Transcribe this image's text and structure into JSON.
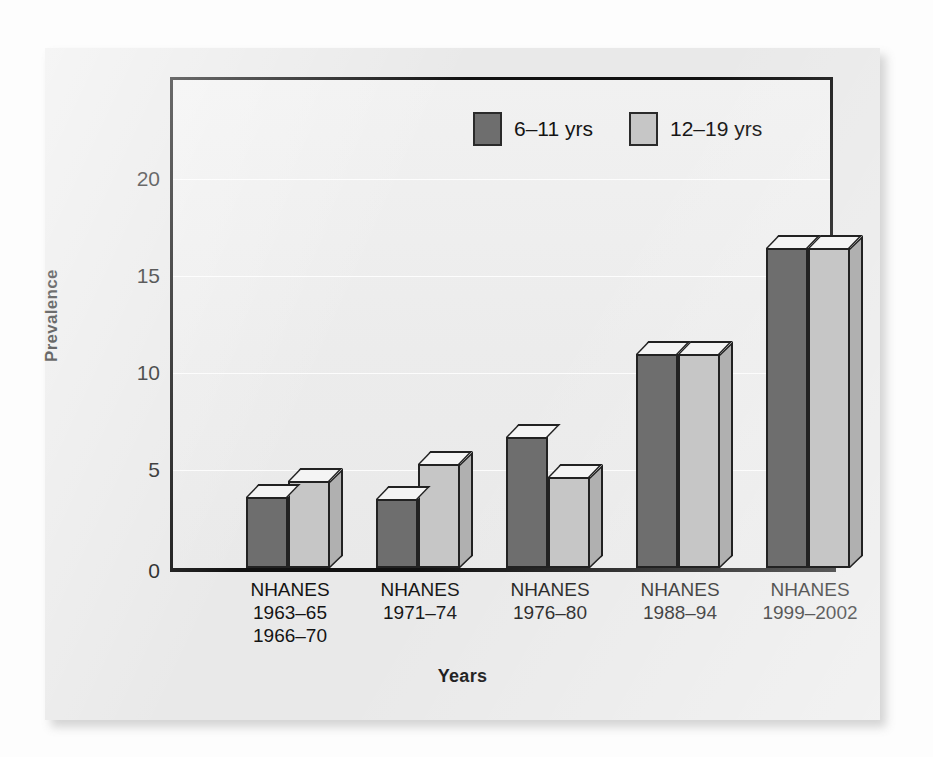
{
  "chart_data": {
    "type": "bar",
    "title": "",
    "xlabel": "Years",
    "ylabel": "Prevalence",
    "ylim": [
      0,
      23.5
    ],
    "yticks": [
      0,
      5,
      10,
      15,
      20
    ],
    "ytick_labels": [
      "0",
      "5",
      "10",
      "15",
      "20"
    ],
    "grid": true,
    "legend_position": "top-center",
    "style": "3d-bar",
    "categories": [
      "NHANES\n1963–65\n1966–70",
      "NHANES\n1971–74",
      "NHANES\n1976–80",
      "NHANES\n1988–94",
      "NHANES\n1999–2002"
    ],
    "series": [
      {
        "name": "6–11 yrs",
        "color": "#6e6e6e",
        "values": [
          3.4,
          3.3,
          6.3,
          10.3,
          15.4
        ]
      },
      {
        "name": "12–19 yrs",
        "color": "#c6c6c6",
        "values": [
          4.2,
          5.0,
          4.4,
          10.3,
          15.4
        ]
      }
    ]
  },
  "legend": {
    "items": [
      {
        "label": "6–11 yrs",
        "color": "#6e6e6e"
      },
      {
        "label": "12–19 yrs",
        "color": "#c6c6c6"
      }
    ]
  },
  "axes": {
    "y_title": "Prevalence",
    "x_title": "Years",
    "y_ticks": [
      "20",
      "15",
      "10",
      "5",
      "0"
    ]
  },
  "colors": {
    "page_background": "#fdfdfd",
    "card_background": "#e9e9e9",
    "plot_background": "#efefef",
    "frame": "#111111",
    "series_dark": "#6e6e6e",
    "series_light": "#c6c6c6",
    "text": "#141414"
  }
}
